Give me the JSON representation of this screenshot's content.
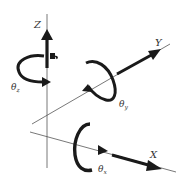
{
  "diagram": {
    "title": "",
    "colors": {
      "line": "#555555",
      "arrow": "#1a1a1a",
      "text": "#333333"
    },
    "axes": [
      {
        "id": "z",
        "label": "Z",
        "rotation_label": "θ",
        "rotation_sub": "z"
      },
      {
        "id": "y",
        "label": "Y",
        "rotation_label": "θ",
        "rotation_sub": "y"
      },
      {
        "id": "x",
        "label": "X",
        "rotation_label": "θ",
        "rotation_sub": "x"
      }
    ]
  }
}
